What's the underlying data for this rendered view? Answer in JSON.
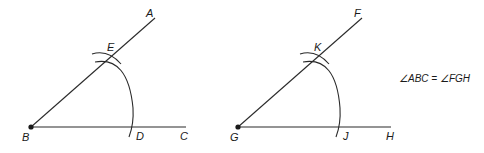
{
  "figure": {
    "left_angle": {
      "vertex": {
        "label": "B",
        "x": 31,
        "y": 127
      },
      "ray_up": {
        "end_label": "A",
        "x2": 155,
        "y2": 18
      },
      "ray_horizontal": {
        "end_label": "C",
        "x2": 186,
        "y2": 127
      },
      "arc_intersection_ray": {
        "label": "E",
        "x": 110,
        "y": 58
      },
      "arc_intersection_base": {
        "label": "D",
        "x": 134,
        "y": 127
      }
    },
    "right_angle": {
      "vertex": {
        "label": "G",
        "x": 238,
        "y": 127
      },
      "ray_up": {
        "end_label": "F",
        "x2": 362,
        "y2": 18
      },
      "ray_horizontal": {
        "end_label": "H",
        "x2": 391,
        "y2": 127
      },
      "arc_intersection_ray": {
        "label": "K",
        "x": 318,
        "y": 58
      },
      "arc_intersection_base": {
        "label": "J",
        "x": 341,
        "y": 127
      }
    },
    "equation": "∠ABC = ∠FGH",
    "colors": {
      "stroke": "#2a2a2a",
      "text": "#1a1a1a",
      "background": "#ffffff"
    }
  }
}
